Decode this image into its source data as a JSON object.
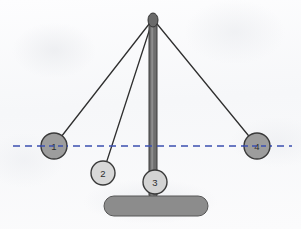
{
  "figure": {
    "background_color": "#fbfbfc",
    "canvas": {
      "width": 301,
      "height": 229
    }
  },
  "stand": {
    "post": {
      "name": "vertical-post",
      "x": 153,
      "top_y": 18,
      "bottom_y": 198,
      "width": 8,
      "fill": "#6e6e6e",
      "highlight": "#8d8d8d",
      "stroke": "#3a3a3a"
    },
    "pivot": {
      "name": "pivot-cap",
      "cx": 153,
      "cy": 20,
      "rx": 5,
      "ry": 7,
      "fill": "#6a6a6a",
      "stroke": "#333333"
    },
    "base": {
      "name": "stand-base",
      "x": 104,
      "y": 196,
      "width": 104,
      "height": 20,
      "radius": 10,
      "fill": "#8c8c8c",
      "stroke": "#565656"
    }
  },
  "reference_line": {
    "name": "horizontal-dashed-reference-line",
    "y": 146,
    "x_start": 13,
    "x_end": 292,
    "color": "#3b4fb0",
    "dash": "7 5",
    "width": 1.6
  },
  "pivot_point": {
    "x": 153,
    "y": 19
  },
  "balls": [
    {
      "id": "ball-1",
      "label": "1",
      "cx": 54,
      "cy": 146,
      "r": 13,
      "fill": "#9d9d9d",
      "stroke": "#3a3a3a",
      "string_color": "#2f2f2f"
    },
    {
      "id": "ball-2",
      "label": "2",
      "cx": 103,
      "cy": 173,
      "r": 12,
      "fill": "#d8d8d8",
      "stroke": "#3a3a3a",
      "string_color": "#2f2f2f"
    },
    {
      "id": "ball-3",
      "label": "3",
      "cx": 155,
      "cy": 182,
      "r": 12,
      "fill": "#d3d3d3",
      "stroke": "#3a3a3a",
      "string_color": "#2f2f2f"
    },
    {
      "id": "ball-4",
      "label": "4",
      "cx": 257,
      "cy": 146,
      "r": 13,
      "fill": "#9d9d9d",
      "stroke": "#3a3a3a",
      "string_color": "#2f2f2f"
    }
  ]
}
